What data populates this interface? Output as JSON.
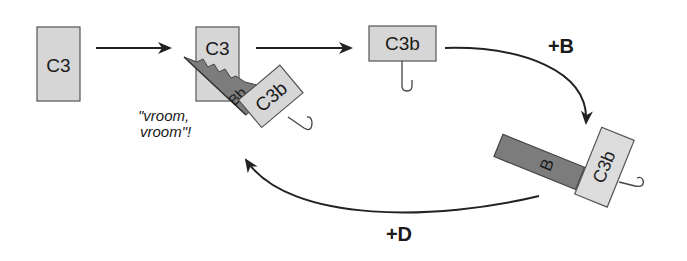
{
  "diagram": {
    "type": "cycle",
    "nodes": {
      "c3_initial": {
        "label": "C3"
      },
      "c3_complex": {
        "label": "C3"
      },
      "bb_fragment": {
        "label": "Bb"
      },
      "c3b_bound": {
        "label": "C3b"
      },
      "c3b_free": {
        "label": "C3b"
      },
      "b_factor": {
        "label": "B"
      },
      "c3b_with_b": {
        "label": "C3b"
      }
    },
    "annotations": {
      "vroom_line1": "\"vroom,",
      "vroom_line2": "vroom\"!"
    },
    "edges": {
      "plus_b": "+B",
      "plus_d": "+D"
    },
    "colors": {
      "light_box": "#d6d6d6",
      "dark_box": "#7c7c7c",
      "stroke": "#555555",
      "arrow": "#222222"
    }
  }
}
